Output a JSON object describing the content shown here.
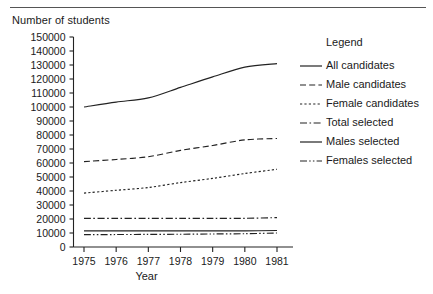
{
  "figure": {
    "y_axis_title": "Number of students",
    "x_axis_title": "Year"
  },
  "legend": {
    "title": "Legend",
    "entries": [
      {
        "label": "All candidates",
        "style": "solid"
      },
      {
        "label": "Male candidates",
        "style": "dashed"
      },
      {
        "label": "Female candidates",
        "style": "dotted"
      },
      {
        "label": "Total selected",
        "style": "dash-dot"
      },
      {
        "label": "Males selected",
        "style": "solid"
      },
      {
        "label": "Females selected",
        "style": "dash-dot-dot"
      }
    ]
  },
  "chart_data": {
    "type": "line",
    "title": "",
    "subtitle": "",
    "xlabel": "Year",
    "ylabel": "Number of students",
    "grid": false,
    "legend_position": "right",
    "x": [
      1975,
      1976,
      1977,
      1978,
      1979,
      1980,
      1981
    ],
    "xtick_labels": [
      "1975",
      "1976",
      "1977",
      "1978",
      "1979",
      "1980",
      "1981"
    ],
    "xlim": [
      1975,
      1981
    ],
    "ylim": [
      0,
      150000
    ],
    "ytick_labels": [
      "0",
      "10000",
      "20000",
      "30000",
      "40000",
      "50000",
      "60000",
      "70000",
      "80000",
      "90000",
      "100000",
      "110000",
      "120000",
      "130000",
      "140000",
      "150000"
    ],
    "ytick_values": [
      0,
      10000,
      20000,
      30000,
      40000,
      50000,
      60000,
      70000,
      80000,
      90000,
      100000,
      110000,
      120000,
      130000,
      140000,
      150000
    ],
    "series": [
      {
        "name": "All candidates",
        "style": "solid",
        "values": [
          100000,
          103500,
          106500,
          114000,
          121500,
          128500,
          131000
        ]
      },
      {
        "name": "Male candidates",
        "style": "dashed",
        "values": [
          61000,
          62500,
          64500,
          69000,
          72500,
          76500,
          77500
        ]
      },
      {
        "name": "Female candidates",
        "style": "dotted",
        "values": [
          38500,
          40500,
          42500,
          46000,
          49000,
          52500,
          55500
        ]
      },
      {
        "name": "Total selected",
        "style": "dash-dot",
        "values": [
          20500,
          20500,
          20500,
          20500,
          20500,
          20500,
          21000
        ]
      },
      {
        "name": "Males selected",
        "style": "solid",
        "values": [
          11500,
          11500,
          11500,
          11500,
          11500,
          11500,
          11800
        ]
      },
      {
        "name": "Females selected",
        "style": "dash-dot-dot",
        "values": [
          8800,
          8900,
          9000,
          9100,
          9300,
          9500,
          10000
        ]
      }
    ]
  }
}
